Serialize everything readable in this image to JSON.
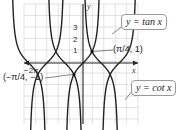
{
  "chart_data": {
    "type": "line",
    "title": "",
    "xlabel": "x",
    "ylabel": "y",
    "grid": true,
    "x_range_label": "-2π",
    "y_tick_labels": [
      "1",
      "2",
      "3"
    ],
    "series": [
      {
        "name": "y = tan x",
        "function": "tan(x)",
        "period": "π",
        "asymptotes": "x = π/2 + kπ"
      },
      {
        "name": "y = cot x",
        "function": "cot(x)",
        "period": "π",
        "asymptotes": "x = kπ"
      }
    ],
    "annotations": [
      {
        "label": "(π/4, 1)",
        "point": [
          0.785,
          1
        ]
      },
      {
        "label": "(−π/4, −1)",
        "point": [
          -0.785,
          -1
        ]
      }
    ],
    "x_domain": [
      -6.6,
      3.3
    ],
    "y_domain": [
      -5.2,
      5.2
    ]
  },
  "labels": {
    "tan_callout": "y = tan x",
    "cot_callout": "y = cot x",
    "y_axis": "y",
    "x_axis": "x",
    "x_tick": "−2π",
    "y_ticks": [
      "3",
      "2",
      "1"
    ],
    "point_pos": "(π/4, 1)",
    "point_neg": "(−π/4, −1)"
  }
}
